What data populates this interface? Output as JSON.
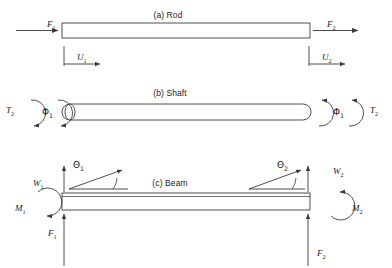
{
  "figure": {
    "panels": [
      {
        "id": "rod",
        "title": "(a) Rod",
        "title_x": 168,
        "title_y": 10,
        "labels": [
          {
            "name": "force-f1",
            "sym": "F",
            "sub": "1",
            "x": 47,
            "y": 19,
            "italic": true
          },
          {
            "name": "force-f2",
            "sym": "F",
            "sub": "2",
            "x": 327,
            "y": 19,
            "italic": true
          },
          {
            "name": "displacement-u1",
            "sym": "U",
            "sub": "1",
            "x": 77,
            "y": 52,
            "italic": true
          },
          {
            "name": "displacement-u2",
            "sym": "U",
            "sub": "2",
            "x": 322,
            "y": 52,
            "italic": true
          }
        ]
      },
      {
        "id": "shaft",
        "title": "(b) Shaft",
        "title_x": 170,
        "title_y": 88,
        "labels": [
          {
            "name": "torque-t2-left",
            "sym": "T",
            "sub": "2",
            "x": 6,
            "y": 105,
            "italic": true
          },
          {
            "name": "twist-phi1-left",
            "sym": "Φ",
            "sub": "1",
            "x": 42,
            "y": 107,
            "italic": false
          },
          {
            "name": "twist-phi1-right",
            "sym": "Φ",
            "sub": "1",
            "x": 333,
            "y": 107,
            "italic": false
          },
          {
            "name": "torque-t2-right",
            "sym": "T",
            "sub": "2",
            "x": 370,
            "y": 105,
            "italic": true
          }
        ]
      },
      {
        "id": "beam",
        "title": "(c) Beam",
        "title_x": 170,
        "title_y": 178,
        "labels": [
          {
            "name": "deflection-w1",
            "sym": "W",
            "sub": "1",
            "x": 33,
            "y": 178,
            "italic": true
          },
          {
            "name": "rotation-theta1",
            "sym": "Θ",
            "sub": "1",
            "x": 73,
            "y": 160,
            "italic": false
          },
          {
            "name": "rotation-theta2",
            "sym": "Θ",
            "sub": "2",
            "x": 277,
            "y": 160,
            "italic": false
          },
          {
            "name": "deflection-w2",
            "sym": "W",
            "sub": "2",
            "x": 333,
            "y": 166,
            "italic": true
          },
          {
            "name": "moment-m1",
            "sym": "M",
            "sub": "1",
            "x": 15,
            "y": 203,
            "italic": true
          },
          {
            "name": "moment-m2",
            "sym": "M",
            "sub": "2",
            "x": 352,
            "y": 203,
            "italic": true
          },
          {
            "name": "reaction-f1",
            "sym": "F",
            "sub": "1",
            "x": 48,
            "y": 228,
            "italic": true
          },
          {
            "name": "reaction-f2",
            "sym": "F",
            "sub": "2",
            "x": 317,
            "y": 248,
            "italic": true
          }
        ]
      }
    ],
    "colors": {
      "stroke": "#3a3a3a",
      "bar_fill": "#ffffff",
      "background": "#ffffff",
      "text": "#1a1a1a"
    }
  }
}
